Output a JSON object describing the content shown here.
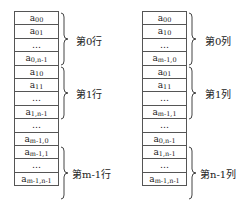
{
  "row_major": {
    "cells": [
      {
        "base": "a",
        "sub": "00"
      },
      {
        "base": "a",
        "sub": "01"
      },
      {
        "base": "…",
        "sub": ""
      },
      {
        "base": "a",
        "sub": "0,n-1"
      },
      {
        "base": "a",
        "sub": "10"
      },
      {
        "base": "a",
        "sub": "11"
      },
      {
        "base": "…",
        "sub": ""
      },
      {
        "base": "a",
        "sub": "1,n-1"
      },
      {
        "base": "…",
        "sub": ""
      },
      {
        "base": "a",
        "sub": "m-1,0"
      },
      {
        "base": "a",
        "sub": "m-1,1"
      },
      {
        "base": "…",
        "sub": ""
      },
      {
        "base": "a",
        "sub": "m-1,n-1"
      }
    ],
    "groups": [
      {
        "label": "第0行",
        "start": 0,
        "end": 3
      },
      {
        "label": "第1行",
        "start": 4,
        "end": 7
      },
      {
        "label": "第m-1行",
        "start": 9,
        "end": 12
      }
    ]
  },
  "column_major": {
    "cells": [
      {
        "base": "a",
        "sub": "00"
      },
      {
        "base": "a",
        "sub": "10"
      },
      {
        "base": "…",
        "sub": ""
      },
      {
        "base": "a",
        "sub": "m-1,0"
      },
      {
        "base": "a",
        "sub": "01"
      },
      {
        "base": "a",
        "sub": "11"
      },
      {
        "base": "…",
        "sub": ""
      },
      {
        "base": "a",
        "sub": "m-1,1"
      },
      {
        "base": "…",
        "sub": ""
      },
      {
        "base": "a",
        "sub": "0,n-1"
      },
      {
        "base": "a",
        "sub": "1,n-1"
      },
      {
        "base": "…",
        "sub": ""
      },
      {
        "base": "a",
        "sub": "m-1,n-1"
      }
    ],
    "groups": [
      {
        "label": "第0列",
        "start": 0,
        "end": 3
      },
      {
        "label": "第1列",
        "start": 4,
        "end": 7
      },
      {
        "label": "第n-1列",
        "start": 9,
        "end": 12
      }
    ]
  }
}
